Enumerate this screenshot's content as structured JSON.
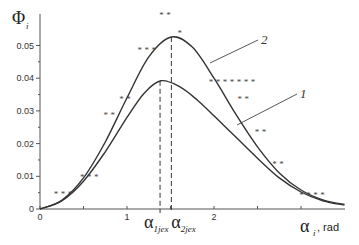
{
  "chart_data": {
    "type": "line",
    "title": "",
    "ylabel": "Φ",
    "ylabel_sub": "i",
    "xlabel": "α",
    "xlabel_sub": "i",
    "xlabel_unit": ", rad",
    "xlim": [
      0,
      3.5
    ],
    "ylim": [
      0,
      0.055
    ],
    "x_ticks": [
      {
        "value": 0,
        "label": "0"
      },
      {
        "value": 0.5,
        "label": ""
      },
      {
        "value": 1,
        "label": "1"
      },
      {
        "value": 1.5,
        "label": ""
      },
      {
        "value": 2,
        "label": "2"
      },
      {
        "value": 2.5,
        "label": ""
      },
      {
        "value": 3,
        "label": ""
      }
    ],
    "y_ticks": [
      {
        "value": 0,
        "label": "0"
      },
      {
        "value": 0.005,
        "label": ""
      },
      {
        "value": 0.01,
        "label": "0.01"
      },
      {
        "value": 0.015,
        "label": ""
      },
      {
        "value": 0.02,
        "label": "0.02"
      },
      {
        "value": 0.025,
        "label": ""
      },
      {
        "value": 0.03,
        "label": "0.03"
      },
      {
        "value": 0.035,
        "label": ""
      },
      {
        "value": 0.04,
        "label": "0.04"
      },
      {
        "value": 0.045,
        "label": ""
      },
      {
        "value": 0.05,
        "label": "0.05"
      }
    ],
    "series": [
      {
        "name": "1",
        "peak_x": 1.39,
        "peak_y": 0.0392,
        "x": [
          0,
          0.25,
          0.5,
          0.75,
          1.0,
          1.2,
          1.39,
          1.6,
          1.8,
          2.0,
          2.25,
          2.5,
          2.75,
          3.0,
          3.25,
          3.5
        ],
        "y": [
          0,
          0.0025,
          0.0085,
          0.0175,
          0.028,
          0.0355,
          0.0392,
          0.0375,
          0.0335,
          0.0285,
          0.022,
          0.0155,
          0.0095,
          0.0052,
          0.0025,
          0.0012
        ]
      },
      {
        "name": "2",
        "peak_x": 1.51,
        "peak_y": 0.0526,
        "x": [
          0,
          0.25,
          0.5,
          0.75,
          1.0,
          1.25,
          1.51,
          1.75,
          2.0,
          2.25,
          2.5,
          2.75,
          3.0,
          3.25,
          3.5
        ],
        "y": [
          0,
          0.0027,
          0.0095,
          0.0205,
          0.034,
          0.0465,
          0.0526,
          0.0495,
          0.04,
          0.029,
          0.019,
          0.011,
          0.0058,
          0.0028,
          0.0014
        ]
      }
    ],
    "markers": [
      {
        "label": "***",
        "x": 0.28,
        "y": 0.005
      },
      {
        "label": "***",
        "x": 0.58,
        "y": 0.01
      },
      {
        "label": "**",
        "x": 0.81,
        "y": 0.029
      },
      {
        "label": "**",
        "x": 0.99,
        "y": 0.034
      },
      {
        "label": "***",
        "x": 1.24,
        "y": 0.049
      },
      {
        "label": "**",
        "x": 1.45,
        "y": 0.0595
      },
      {
        "label": "*",
        "x": 1.62,
        "y": 0.054
      },
      {
        "label": "*******",
        "x": 2.22,
        "y": 0.039
      },
      {
        "label": "**",
        "x": 2.35,
        "y": 0.034
      },
      {
        "label": "**",
        "x": 2.55,
        "y": 0.024
      },
      {
        "label": "**",
        "x": 2.75,
        "y": 0.014
      },
      {
        "label": "****",
        "x": 3.14,
        "y": 0.0045
      }
    ],
    "vlines": [
      {
        "x": 1.38,
        "label": "α",
        "sub": "1jex"
      },
      {
        "x": 1.51,
        "label": "α",
        "sub": "2jex"
      }
    ],
    "curve_labels": [
      {
        "text": "1",
        "series": "1"
      },
      {
        "text": "2",
        "series": "2"
      }
    ],
    "grid": false,
    "legend": "none"
  }
}
